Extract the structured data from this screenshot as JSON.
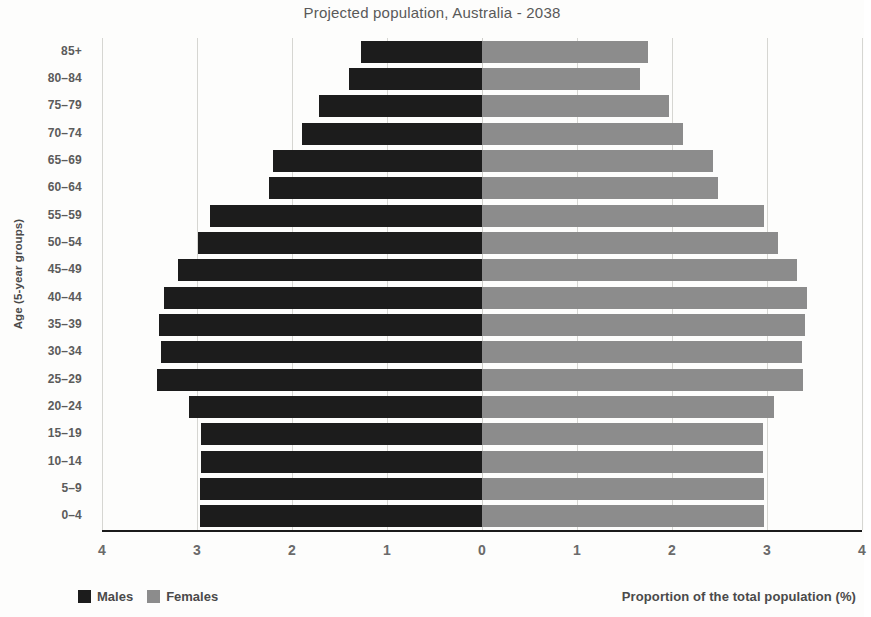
{
  "chart_data": {
    "type": "bar",
    "subtype": "population-pyramid",
    "title": "Projected population, Australia - 2038",
    "xlabel": "Proportion of the total population (%)",
    "ylabel": "Age (5-year groups)",
    "grid": true,
    "legend_position": "bottom-left",
    "xlim": [
      -4,
      4
    ],
    "xticks": [
      4,
      3,
      2,
      1,
      0,
      1,
      2,
      3,
      4
    ],
    "xtick_values": [
      -4,
      -3,
      -2,
      -1,
      0,
      1,
      2,
      3,
      4
    ],
    "categories": [
      "0–4",
      "5–9",
      "10–14",
      "15–19",
      "20–24",
      "25–29",
      "30–34",
      "35–39",
      "40–44",
      "45–49",
      "50–54",
      "55–59",
      "60–64",
      "65–69",
      "70–74",
      "75–79",
      "80–84",
      "85+"
    ],
    "series": [
      {
        "name": "Males",
        "color": "#1c1c1c",
        "side": "left",
        "values": [
          2.97,
          2.97,
          2.96,
          2.96,
          3.08,
          3.42,
          3.38,
          3.4,
          3.35,
          3.2,
          2.99,
          2.86,
          2.24,
          2.2,
          1.9,
          1.72,
          1.4,
          1.27
        ]
      },
      {
        "name": "Females",
        "color": "#8c8c8c",
        "side": "right",
        "values": [
          2.97,
          2.97,
          2.96,
          2.96,
          3.07,
          3.38,
          3.37,
          3.4,
          3.42,
          3.32,
          3.12,
          2.97,
          2.48,
          2.43,
          2.12,
          1.97,
          1.66,
          1.75
        ]
      }
    ]
  },
  "legend": {
    "males_label": "Males",
    "females_label": "Females"
  }
}
